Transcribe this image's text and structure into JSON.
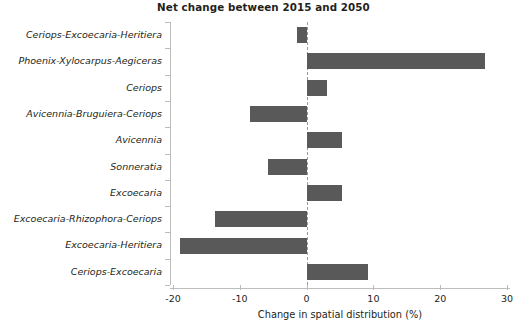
{
  "chart_data": {
    "type": "bar",
    "orientation": "horizontal",
    "title": "Net change between 2015 and 2050",
    "xlabel": "Change in spatial distribution (%)",
    "ylabel": "",
    "xlim": [
      -20,
      30
    ],
    "xticks": [
      -20,
      -10,
      0,
      10,
      20,
      30
    ],
    "xtick_labels": [
      "-20",
      "-10",
      "0",
      "10",
      "20",
      "30"
    ],
    "grid": false,
    "legend": null,
    "zero_line": true,
    "bar_color": "#595959",
    "axis_color": "#bdbdbd",
    "categories": [
      "Ceriops-Excoecaria-Heritiera",
      "Phoenix-Xylocarpus-Aegiceras",
      "Ceriops",
      "Avicennia-Bruguiera-Ceriops",
      "Avicennia",
      "Sonneratia",
      "Excoecaria",
      "Excoecaria-Rhizophora-Ceriops",
      "Excoecaria-Heritiera",
      "Ceriops-Excoecaria"
    ],
    "values": [
      -1.4,
      26.7,
      3.0,
      -8.5,
      5.3,
      -5.8,
      5.3,
      -13.7,
      -19.0,
      9.2
    ]
  }
}
